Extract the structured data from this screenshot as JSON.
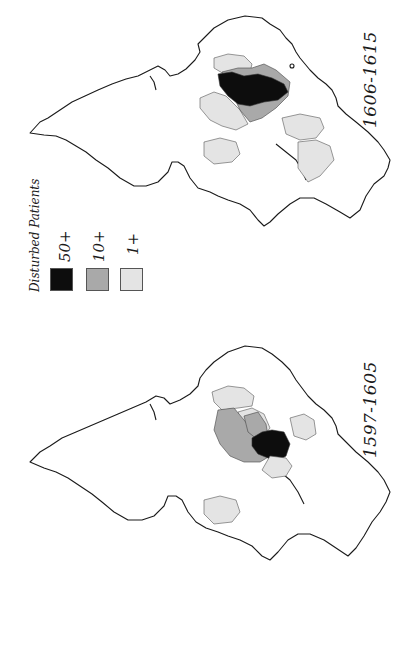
{
  "figure": {
    "panels": [
      {
        "id": "top",
        "period": "1606-1615"
      },
      {
        "id": "bottom",
        "period": "1597-1605"
      }
    ],
    "legend": {
      "title": "Disturbed Patients",
      "items": [
        {
          "label": "50+",
          "color": "#0d0d0d"
        },
        {
          "label": "10+",
          "color": "#a9a9a9"
        },
        {
          "label": "1+",
          "color": "#e4e4e4"
        }
      ]
    }
  }
}
